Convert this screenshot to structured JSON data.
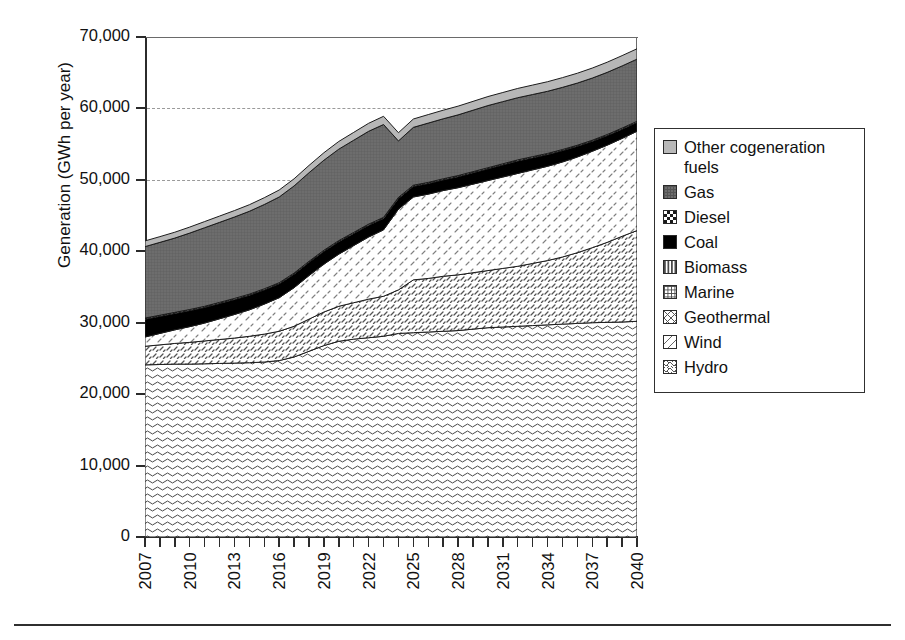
{
  "axes": {
    "ylabel": "Generation (GWh per year)",
    "xlabel": "",
    "yticks": [
      "0",
      "10,000",
      "20,000",
      "30,000",
      "40,000",
      "50,000",
      "60,000",
      "70,000"
    ],
    "xticks": [
      "2007",
      "2010",
      "2013",
      "2016",
      "2019",
      "2022",
      "2025",
      "2028",
      "2031",
      "2034",
      "2037",
      "2040"
    ]
  },
  "legend": {
    "items": [
      {
        "label": "Other cogeneration fuels",
        "swatch": "cogen-swatch-icon",
        "color": "#b9b9b9"
      },
      {
        "label": "Gas",
        "swatch": "gas-swatch-icon",
        "color": "#6e6e6e"
      },
      {
        "label": "Diesel",
        "swatch": "diesel-swatch-icon",
        "color": "#1a1a1a"
      },
      {
        "label": "Coal",
        "swatch": "coal-swatch-icon",
        "color": "#000000"
      },
      {
        "label": "Biomass",
        "swatch": "biomass-swatch-icon",
        "color": "#4a4a4a"
      },
      {
        "label": "Marine",
        "swatch": "marine-swatch-icon",
        "color": "#4a4a4a"
      },
      {
        "label": "Geothermal",
        "swatch": "geothermal-swatch-icon",
        "color": "#555555"
      },
      {
        "label": "Wind",
        "swatch": "wind-swatch-icon",
        "color": "#666666"
      },
      {
        "label": "Hydro",
        "swatch": "hydro-swatch-icon",
        "color": "#555555"
      }
    ]
  },
  "chart_data": {
    "type": "area",
    "title": "",
    "subtitle": "",
    "xlabel": "",
    "ylabel": "Generation (GWh per year)",
    "xlim": [
      2007,
      2040
    ],
    "ylim": [
      0,
      70000
    ],
    "ytick_values": [
      0,
      10000,
      20000,
      30000,
      40000,
      50000,
      60000,
      70000
    ],
    "gridlines": {
      "y_dashed_at": [
        50000,
        60000
      ],
      "x": false
    },
    "legend_position": "right",
    "stacking": "stacked-area-bottom-to-top",
    "stack_order_bottom_to_top": [
      "Hydro",
      "Geothermal",
      "Wind",
      "Marine",
      "Biomass",
      "Coal",
      "Diesel",
      "Gas",
      "Other cogeneration fuels"
    ],
    "x": [
      2007,
      2008,
      2009,
      2010,
      2011,
      2012,
      2013,
      2014,
      2015,
      2016,
      2017,
      2018,
      2019,
      2020,
      2021,
      2022,
      2023,
      2024,
      2025,
      2026,
      2027,
      2028,
      2029,
      2030,
      2031,
      2032,
      2033,
      2034,
      2035,
      2036,
      2037,
      2038,
      2039,
      2040
    ],
    "series": [
      {
        "name": "Hydro",
        "values": [
          24100,
          24150,
          24200,
          24200,
          24250,
          24300,
          24350,
          24400,
          24500,
          24700,
          25200,
          26000,
          26800,
          27400,
          27700,
          27900,
          28100,
          28500,
          28600,
          28700,
          28800,
          28900,
          29100,
          29300,
          29400,
          29500,
          29600,
          29700,
          29800,
          29900,
          30000,
          30050,
          30100,
          30200
        ]
      },
      {
        "name": "Geothermal",
        "values": [
          2600,
          2750,
          2900,
          3050,
          3200,
          3350,
          3500,
          3700,
          3900,
          4100,
          4300,
          4500,
          4700,
          4900,
          5100,
          5400,
          5600,
          6100,
          7400,
          7500,
          7700,
          7800,
          7900,
          8000,
          8200,
          8400,
          8700,
          9000,
          9400,
          9900,
          10500,
          11200,
          12000,
          12700
        ]
      },
      {
        "name": "Wind",
        "values": [
          1300,
          1600,
          1900,
          2200,
          2500,
          2900,
          3300,
          3700,
          4200,
          4700,
          5400,
          6100,
          6700,
          7300,
          8000,
          8700,
          9300,
          11300,
          11600,
          11800,
          12000,
          12200,
          12400,
          12600,
          12800,
          13000,
          13100,
          13200,
          13300,
          13400,
          13500,
          13600,
          13700,
          13900
        ]
      },
      {
        "name": "Marine",
        "values": [
          0,
          0,
          0,
          0,
          0,
          0,
          0,
          0,
          0,
          0,
          0,
          0,
          0,
          0,
          0,
          0,
          0,
          0,
          0,
          0,
          0,
          0,
          0,
          0,
          0,
          0,
          0,
          0,
          0,
          0,
          0,
          0,
          0,
          0
        ]
      },
      {
        "name": "Biomass",
        "values": [
          0,
          0,
          0,
          0,
          0,
          0,
          0,
          0,
          0,
          0,
          0,
          0,
          0,
          0,
          0,
          0,
          0,
          0,
          0,
          0,
          0,
          0,
          0,
          0,
          0,
          0,
          0,
          0,
          0,
          0,
          0,
          0,
          0,
          0
        ]
      },
      {
        "name": "Coal",
        "values": [
          2500,
          2400,
          2300,
          2250,
          2200,
          2150,
          2100,
          2050,
          2000,
          1950,
          1900,
          1850,
          1800,
          1750,
          1700,
          1650,
          1600,
          1500,
          1500,
          1500,
          1500,
          1550,
          1600,
          1650,
          1700,
          1750,
          1700,
          1650,
          1600,
          1500,
          1400,
          1350,
          1300,
          1250
        ]
      },
      {
        "name": "Diesel",
        "values": [
          150,
          150,
          150,
          150,
          150,
          150,
          150,
          150,
          150,
          150,
          150,
          150,
          150,
          150,
          150,
          150,
          150,
          150,
          150,
          150,
          150,
          150,
          150,
          150,
          150,
          150,
          150,
          150,
          150,
          150,
          150,
          150,
          150,
          150
        ]
      },
      {
        "name": "Gas",
        "values": [
          10000,
          10200,
          10400,
          10700,
          11000,
          11200,
          11400,
          11600,
          11800,
          12000,
          12200,
          12400,
          12600,
          12800,
          12900,
          13000,
          13000,
          7900,
          8100,
          8300,
          8400,
          8500,
          8600,
          8700,
          8700,
          8700,
          8700,
          8700,
          8700,
          8700,
          8700,
          8700,
          8700,
          8700
        ]
      },
      {
        "name": "Other cogeneration fuels",
        "values": [
          800,
          800,
          820,
          840,
          860,
          880,
          900,
          920,
          950,
          980,
          1000,
          1020,
          1050,
          1080,
          1100,
          1120,
          1150,
          1150,
          1170,
          1190,
          1200,
          1220,
          1240,
          1260,
          1280,
          1300,
          1320,
          1340,
          1360,
          1380,
          1400,
          1420,
          1440,
          1450
        ]
      }
    ],
    "totals": [
      41450,
      42050,
      42670,
      43390,
      44160,
      44930,
      45700,
      46520,
      47500,
      48580,
      50150,
      51850,
      53600,
      55180,
      56650,
      57920,
      58900,
      66700,
      69000,
      69790,
      70550,
      71120,
      71890,
      72460,
      73020,
      73600,
      74050,
      74490,
      75050,
      75680,
      76450,
      77170,
      77910,
      78700
    ]
  }
}
